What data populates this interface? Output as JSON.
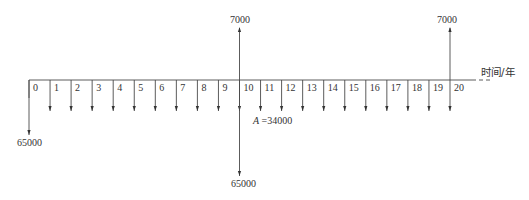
{
  "chart_data": {
    "type": "cash_flow_diagram",
    "title": "",
    "xlabel": "时间/年",
    "periods": [
      0,
      1,
      2,
      3,
      4,
      5,
      6,
      7,
      8,
      9,
      10,
      11,
      12,
      13,
      14,
      15,
      16,
      17,
      18,
      19,
      20
    ],
    "tick_labels": [
      "0",
      "1",
      "2",
      "3",
      "4",
      "5",
      "6",
      "7",
      "8",
      "9",
      "10",
      "11",
      "12",
      "13",
      "14",
      "15",
      "16",
      "17",
      "18",
      "19",
      "20"
    ],
    "inflows": [
      {
        "period": 10,
        "value": 7000,
        "label": "7000"
      },
      {
        "period": 20,
        "value": 7000,
        "label": "7000"
      }
    ],
    "outflows": [
      {
        "period": 0,
        "value": 65000,
        "label": "65000"
      },
      {
        "period": 10,
        "value": 65000,
        "label": "65000"
      }
    ],
    "annuity": {
      "label": "A =34000",
      "symbol": "A",
      "value": 34000,
      "from_period": 1,
      "to_period": 20,
      "direction": "down"
    }
  },
  "labels": {
    "axis_title": "时间/年",
    "inflow_10": "7000",
    "inflow_20": "7000",
    "outflow_0": "65000",
    "outflow_10": "65000",
    "annuity_symbol": "A",
    "annuity_value": " =34000"
  }
}
